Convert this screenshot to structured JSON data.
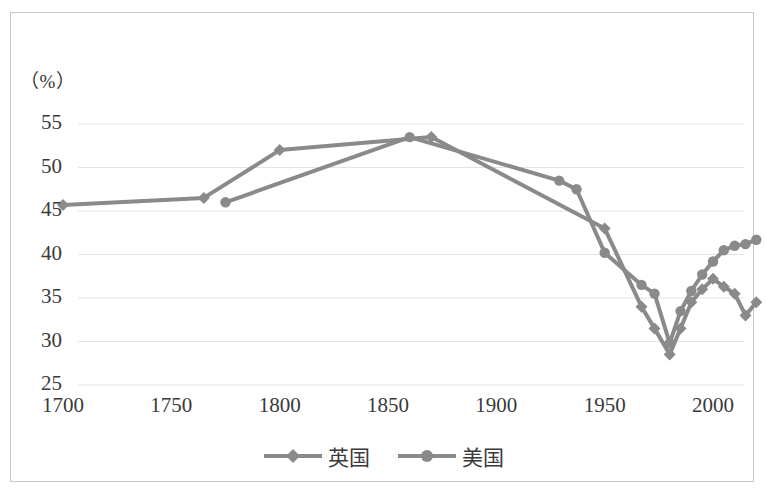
{
  "chart_data": {
    "type": "line",
    "title": "",
    "subtitle": "",
    "xlabel": "",
    "ylabel": "",
    "unit_label": "（%）",
    "xlim": [
      1690,
      2030
    ],
    "ylim": [
      25,
      55
    ],
    "xticks": [
      1700,
      1750,
      1800,
      1850,
      1900,
      1950,
      2000
    ],
    "xtick_labels": [
      "1700",
      "1750",
      "1800",
      "1850",
      "1900",
      "1950",
      "2000"
    ],
    "yticks": [
      25,
      30,
      35,
      40,
      45,
      50,
      55
    ],
    "ytick_labels": [
      "25",
      "30",
      "35",
      "40",
      "45",
      "50",
      "55"
    ],
    "grid": true,
    "grid_axis": "y",
    "legend_position": "bottom",
    "line_color": "#8a8a8a",
    "grid_color": "#e3e3e3",
    "text_color": "#3a3a3a",
    "series": [
      {
        "name": "英国",
        "marker": "diamond",
        "color": "#8a8a8a",
        "x": [
          1700,
          1765,
          1800,
          1870,
          1950,
          1967,
          1973,
          1980,
          1985,
          1990,
          1995,
          2000,
          2005,
          2010,
          2015,
          2020
        ],
        "values": [
          45.7,
          46.5,
          52.0,
          53.5,
          43.0,
          34.0,
          31.5,
          28.5,
          31.5,
          34.5,
          36.0,
          37.2,
          36.3,
          35.5,
          33.0,
          34.5
        ]
      },
      {
        "name": "美国",
        "marker": "circle",
        "color": "#8a8a8a",
        "x": [
          1775,
          1860,
          1929,
          1937,
          1950,
          1967,
          1973,
          1980,
          1985,
          1990,
          1995,
          2000,
          2005,
          2010,
          2015,
          2020
        ],
        "values": [
          46.0,
          53.5,
          48.5,
          47.5,
          40.2,
          36.5,
          35.5,
          29.8,
          33.5,
          35.8,
          37.7,
          39.2,
          40.5,
          41.0,
          41.2,
          41.7
        ]
      }
    ]
  },
  "legend": {
    "items": [
      {
        "label": "英国",
        "marker": "diamond"
      },
      {
        "label": "美国",
        "marker": "circle"
      }
    ]
  }
}
